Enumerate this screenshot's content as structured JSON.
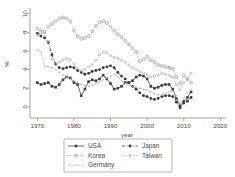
{
  "chart_data": {
    "type": "line",
    "title": "",
    "xlabel": "year",
    "ylabel": "%",
    "xlim": [
      1968,
      2021
    ],
    "ylim": [
      -1.2,
      10.4
    ],
    "xticks": [
      1970,
      1980,
      1990,
      2000,
      2010,
      2020
    ],
    "yticks": [
      0,
      2,
      4,
      6,
      8,
      10
    ],
    "grid": false,
    "legend_position": "below-center",
    "legend_columns": 2,
    "series": [
      {
        "name": "USA",
        "marker": "filled-square",
        "linestyle": "solid",
        "color": "#404040",
        "x": [
          1970,
          1971,
          1972,
          1973,
          1974,
          1975,
          1976,
          1977,
          1978,
          1979,
          1980,
          1981,
          1982,
          1983,
          1984,
          1985,
          1986,
          1987,
          1988,
          1989,
          1990,
          1991,
          1992,
          1993,
          1994,
          1995,
          1996,
          1997,
          1998,
          1999,
          2000,
          2001,
          2002,
          2003,
          2004,
          2005,
          2006,
          2007,
          2008,
          2009,
          2010,
          2011,
          2012
        ],
        "y": [
          2.6,
          2.4,
          2.5,
          2.6,
          2.2,
          2.1,
          2.4,
          2.9,
          3.2,
          3.1,
          2.6,
          2.4,
          1.2,
          1.9,
          2.7,
          2.9,
          2.8,
          3.0,
          3.4,
          3.0,
          2.5,
          1.9,
          2.0,
          2.2,
          2.6,
          2.6,
          2.8,
          3.2,
          3.4,
          3.3,
          3.0,
          2.2,
          2.0,
          2.1,
          2.3,
          2.4,
          2.4,
          1.9,
          0.9,
          0.1,
          0.6,
          1.0,
          1.6
        ]
      },
      {
        "name": "Japan",
        "marker": "filled-circle",
        "linestyle": "dash-dot",
        "color": "#3a3a3a",
        "x": [
          1970,
          1971,
          1972,
          1973,
          1974,
          1975,
          1976,
          1977,
          1978,
          1979,
          1980,
          1981,
          1982,
          1983,
          1984,
          1985,
          1986,
          1987,
          1988,
          1989,
          1990,
          1991,
          1992,
          1993,
          1994,
          1995,
          1996,
          1997,
          1998,
          1999,
          2000,
          2001,
          2002,
          2003,
          2004,
          2005,
          2006,
          2007,
          2008,
          2009,
          2010,
          2011,
          2012
        ],
        "y": [
          7.9,
          7.6,
          7.4,
          6.9,
          5.6,
          4.6,
          4.2,
          4.1,
          4.2,
          4.3,
          4.2,
          3.9,
          3.7,
          3.5,
          3.6,
          3.8,
          3.9,
          4.0,
          4.2,
          4.3,
          4.4,
          4.2,
          3.7,
          3.3,
          3.0,
          2.6,
          2.2,
          1.9,
          1.5,
          1.2,
          1.1,
          0.9,
          0.8,
          0.9,
          1.1,
          1.2,
          1.2,
          1.1,
          0.5,
          -0.1,
          0.4,
          0.6,
          1.0
        ]
      },
      {
        "name": "Korea",
        "marker": "open-circle",
        "linestyle": "dotted",
        "color": "#8d8d8d",
        "x": [
          1970,
          1971,
          1972,
          1973,
          1974,
          1975,
          1976,
          1977,
          1978,
          1979,
          1980,
          1981,
          1982,
          1983,
          1984,
          1985,
          1986,
          1987,
          1988,
          1989,
          1990,
          1991,
          1992,
          1993,
          1994,
          1995,
          1996,
          1997,
          1998,
          1999,
          2000,
          2001,
          2002,
          2003,
          2004,
          2005,
          2006,
          2007,
          2008,
          2009,
          2010,
          2011,
          2012
        ],
        "y": [
          8.4,
          8.0,
          8.1,
          8.6,
          8.9,
          9.2,
          9.5,
          9.6,
          9.5,
          9.2,
          8.2,
          7.6,
          7.3,
          7.4,
          7.6,
          8.1,
          8.7,
          9.1,
          9.2,
          9.0,
          8.6,
          8.2,
          7.8,
          7.5,
          7.1,
          6.7,
          6.3,
          5.9,
          4.9,
          5.1,
          5.4,
          5.0,
          4.8,
          4.5,
          4.4,
          4.3,
          4.2,
          4.1,
          3.2,
          2.5,
          3.4,
          3.0,
          2.6
        ]
      },
      {
        "name": "Taiwan",
        "marker": "open-circle-small",
        "linestyle": "dotted",
        "color": "#a0a0a0",
        "x": [
          1970,
          1971,
          1972,
          1973,
          1974,
          1975,
          1976,
          1977,
          1978,
          1979,
          1980,
          1981,
          1982,
          1983,
          1984,
          1985,
          1986,
          1987,
          1988,
          1989,
          1990,
          1991,
          1992,
          1993,
          1994,
          1995,
          1996,
          1997,
          1998,
          1999,
          2000,
          2001,
          2002,
          2003,
          2004,
          2005,
          2006,
          2007,
          2008,
          2009,
          2010,
          2011,
          2012
        ],
        "y": [
          7.7,
          8.3,
          7.9,
          7.0,
          5.1,
          4.6,
          4.8,
          5.0,
          5.2,
          5.1,
          4.6,
          4.1,
          3.9,
          4.0,
          4.3,
          4.5,
          5.0,
          5.6,
          5.9,
          5.8,
          5.5,
          5.3,
          5.2,
          5.0,
          4.8,
          4.5,
          4.2,
          4.0,
          3.8,
          3.6,
          3.4,
          3.2,
          3.3,
          3.4,
          3.6,
          3.5,
          3.4,
          3.2,
          2.4,
          1.8,
          2.6,
          2.9,
          3.6
        ]
      },
      {
        "name": "Germany",
        "marker": "small-dot",
        "linestyle": "dashed",
        "color": "#b0b0b0",
        "x": [
          1970,
          1971,
          1972,
          1973,
          1974,
          1975,
          1976,
          1977,
          1978,
          1979,
          1980,
          1981,
          1982,
          1983,
          1984,
          1985,
          1986,
          1987,
          1988,
          1989,
          1990,
          1991,
          1992,
          1993,
          1994,
          1995,
          1996,
          1997,
          1998,
          1999,
          2000,
          2001,
          2002,
          2003,
          2004,
          2005,
          2006,
          2007,
          2008,
          2009,
          2010,
          2011,
          2012
        ],
        "y": [
          6.1,
          5.9,
          4.4,
          4.3,
          4.2,
          4.0,
          3.7,
          3.4,
          3.2,
          3.0,
          2.8,
          2.6,
          2.4,
          2.3,
          2.2,
          2.3,
          2.5,
          2.7,
          2.9,
          3.1,
          3.3,
          3.5,
          3.2,
          2.8,
          2.5,
          2.3,
          2.2,
          2.1,
          2.0,
          1.9,
          1.8,
          1.6,
          1.4,
          1.3,
          1.3,
          1.4,
          1.6,
          1.7,
          1.2,
          0.3,
          0.9,
          1.5,
          1.8
        ]
      }
    ]
  },
  "axes": {
    "xlabel": "year",
    "ylabel": "%",
    "xtick_labels": [
      "1970",
      "1980",
      "1990",
      "2000",
      "2010",
      "2020"
    ],
    "ytick_labels": [
      "0",
      "2",
      "4",
      "6",
      "8",
      "10"
    ]
  },
  "legend": {
    "entries": [
      {
        "label": "USA"
      },
      {
        "label": "Japan"
      },
      {
        "label": "Korea"
      },
      {
        "label": "Taiwan"
      },
      {
        "label": "Germany"
      }
    ]
  }
}
